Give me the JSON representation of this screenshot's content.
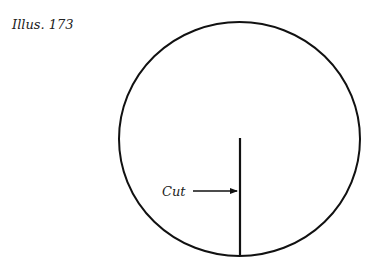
{
  "caption": "Illus. 173",
  "diagram": {
    "shape": "circle",
    "annotation_label": "Cut",
    "colors": {
      "stroke": "#111111",
      "background": "#ffffff"
    }
  }
}
